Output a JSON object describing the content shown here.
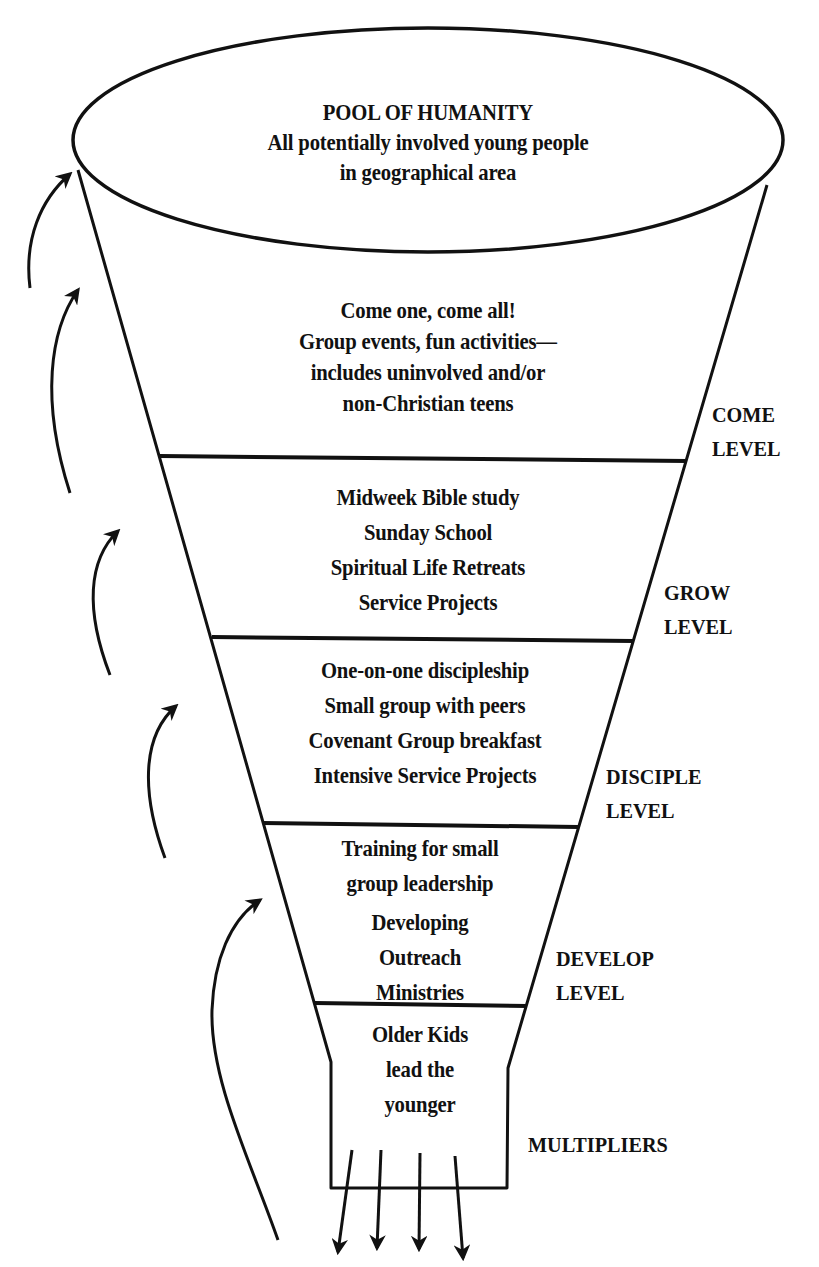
{
  "diagram": {
    "type": "funnel",
    "stroke_color": "#111111",
    "background": "#ffffff",
    "pool": {
      "title": "POOL OF HUMANITY",
      "lines": [
        "All potentially involved young people",
        "in geographical area"
      ]
    },
    "levels": [
      {
        "id": "come",
        "lines": [
          "Come one, come all!",
          "Group events, fun activities—",
          "includes uninvolved and/or",
          "non-Christian teens"
        ],
        "label": [
          "COME",
          "LEVEL"
        ]
      },
      {
        "id": "grow",
        "lines": [
          "Midweek Bible study",
          "Sunday School",
          "Spiritual Life Retreats",
          "Service Projects"
        ],
        "label": [
          "GROW",
          "LEVEL"
        ]
      },
      {
        "id": "disciple",
        "lines": [
          "One-on-one discipleship",
          "Small group with peers",
          "Covenant Group breakfast",
          "Intensive Service Projects"
        ],
        "label": [
          "DISCIPLE",
          "LEVEL"
        ]
      },
      {
        "id": "develop",
        "lines": [
          "Training for small",
          "group leadership",
          "Developing",
          "Outreach",
          "Ministries"
        ],
        "label": [
          "DEVELOP",
          "LEVEL"
        ]
      },
      {
        "id": "multipliers",
        "lines": [
          "Older Kids",
          "lead the",
          "younger"
        ],
        "label": [
          "MULTIPLIERS"
        ]
      }
    ],
    "feedback_arrows": 5,
    "output_arrows": 4
  }
}
